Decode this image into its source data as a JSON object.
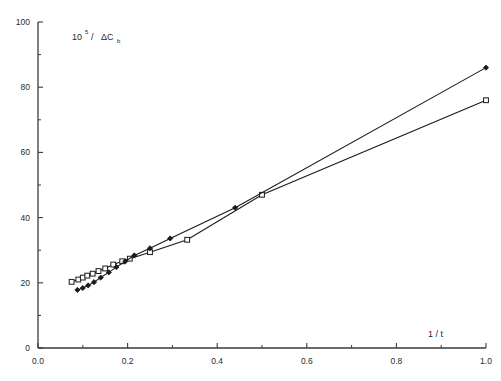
{
  "chart_data": {
    "type": "line",
    "title": "",
    "subtitle": "",
    "xlabel": "1 / t",
    "ylabel_base": "10",
    "ylabel_exponent": "5",
    "ylabel_rest": "/",
    "ylabel_delta": "ΔC",
    "ylabel_subscript": "b",
    "ylabel_full": "10⁵ / ΔC_b",
    "xlim": [
      0.0,
      1.0
    ],
    "ylim": [
      0,
      100
    ],
    "xticks": [
      0.0,
      0.2,
      0.4,
      0.6,
      0.8,
      1.0
    ],
    "xtick_labels": [
      "0.0",
      "0.2",
      "0.4",
      "0.6",
      "0.8",
      "1.0"
    ],
    "xminor_ticks": [
      0.1,
      0.3,
      0.5,
      0.7,
      0.9
    ],
    "yticks": [
      0,
      20,
      40,
      60,
      80,
      100
    ],
    "ytick_labels": [
      "0",
      "20",
      "40",
      "60",
      "80",
      "100"
    ],
    "yminor_ticks": [
      10,
      30,
      50,
      70,
      90
    ],
    "grid": false,
    "legend_position": "none",
    "line_color": "#1a1a1a",
    "series": [
      {
        "name": "open-square-series",
        "marker": "open-square",
        "marker_fill": "#ffffff",
        "marker_stroke": "#1a1a1a",
        "x": [
          0.075,
          0.09,
          0.1,
          0.11,
          0.122,
          0.135,
          0.15,
          0.168,
          0.188,
          0.205,
          0.25,
          0.333,
          0.5,
          1.0
        ],
        "y": [
          20.3,
          21.0,
          21.6,
          22.2,
          22.8,
          23.6,
          24.4,
          25.6,
          26.6,
          27.4,
          29.4,
          33.2,
          47.0,
          76.0
        ]
      },
      {
        "name": "filled-diamond-series",
        "marker": "filled-diamond",
        "marker_fill": "#1a1a1a",
        "marker_stroke": "#1a1a1a",
        "x": [
          0.088,
          0.1,
          0.112,
          0.125,
          0.14,
          0.158,
          0.175,
          0.195,
          0.215,
          0.25,
          0.295,
          0.44,
          1.0
        ],
        "y": [
          17.8,
          18.4,
          19.2,
          20.2,
          21.6,
          23.2,
          24.8,
          26.6,
          28.4,
          30.6,
          33.6,
          43.0,
          86.0
        ]
      }
    ]
  },
  "axes": {
    "x_axis_name": "x-axis",
    "y_axis_name": "y-axis"
  }
}
